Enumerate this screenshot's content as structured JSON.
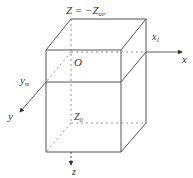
{
  "diagram": {
    "type": "3d-box-coordinate-system",
    "labels": {
      "top_plane": "Z = −Z",
      "top_plane_sub": "air",
      "x_axis": "x",
      "x1": "x",
      "x1_sub": "1",
      "origin": "O",
      "y_m": "y",
      "y_m_sub": "m",
      "y_axis": "y",
      "z0": "Z",
      "z0_sub": "0",
      "z_axis": "z"
    },
    "colors": {
      "line": "#555555",
      "dashed": "#777777",
      "text": "#333333"
    }
  }
}
